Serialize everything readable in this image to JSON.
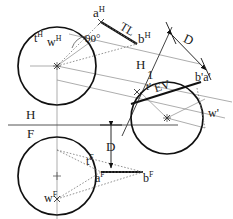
{
  "drawing": {
    "title": "Descriptive geometry: line AB with tangent circles, H/F and H/1 views",
    "colors": {
      "background": "#ffffff",
      "heavy_line": "#111111",
      "thin_line": "#8a8a8a",
      "dotted_line": "#777777",
      "label_text": "#1a1a1a"
    }
  },
  "labels": {
    "a_h": {
      "base": "a",
      "sup": "H"
    },
    "b_h": {
      "base": "b",
      "sup": "H"
    },
    "t_h": {
      "base": "t",
      "sup": "H"
    },
    "w_h": {
      "base": "w",
      "sup": "H"
    },
    "a_f": {
      "base": "a",
      "sup": "F"
    },
    "b_f": {
      "base": "b",
      "sup": "F"
    },
    "t_f": {
      "base": "t",
      "sup": "F"
    },
    "w_f": {
      "base": "w",
      "sup": "F"
    },
    "b1a1": "b'a'",
    "t1": "t'",
    "w1": "w'",
    "tl": "TL",
    "ev": "EV",
    "angle": "90°",
    "fold_h_top": "H",
    "fold_f_bottom": "F",
    "fold_h_upper": "H",
    "fold_1_lower": "1",
    "dim_d_upper": "D",
    "dim_d_lower": "D"
  }
}
